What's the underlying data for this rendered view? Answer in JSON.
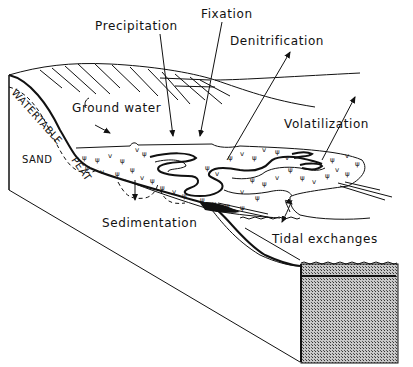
{
  "figure": {
    "type": "block diagram of coastal salt marsh nitrogen cycle",
    "labels": {
      "precipitation": "Precipitation",
      "fixation": "Fixation",
      "denitrification": "Denitrification",
      "volatilization": "Volatilization",
      "ground_water": "Ground water",
      "sedimentation": "Sedimentation",
      "tidal_exchanges": "Tidal exchanges",
      "sand": "SAND",
      "watertable": "WATERTABLE",
      "peat": "PEAT"
    },
    "colors": {
      "ink": "#111111",
      "background": "#ffffff",
      "water_block": "#9a9a9a"
    }
  }
}
